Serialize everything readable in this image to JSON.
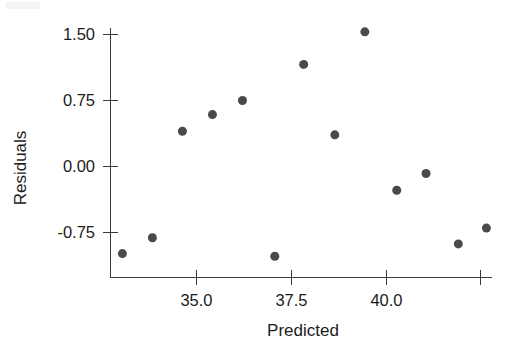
{
  "chart_data": {
    "type": "scatter",
    "title": "",
    "subtitle": "",
    "xlabel": "Predicted",
    "ylabel": "Residuals",
    "xlim": [
      32.6,
      43.1
    ],
    "ylim": [
      -1.15,
      1.7
    ],
    "x_ticks": [
      35.0,
      37.5,
      40.0,
      42.5
    ],
    "x_tick_labels": [
      "35.0",
      "37.5",
      "40.0",
      ""
    ],
    "y_ticks": [
      -0.75,
      0.0,
      0.75,
      1.5
    ],
    "y_tick_labels": [
      "-0.75",
      "0.00",
      "0.75",
      "1.50"
    ],
    "grid": false,
    "legend": null,
    "legend_position": "none",
    "marker": "filled-circle",
    "marker_color": "#4a4a4a",
    "marker_size": 9,
    "axis_color": "#3a3a3a",
    "background_color": "#ffffff",
    "n_points": 13,
    "x": [
      33.05,
      33.84,
      34.63,
      35.42,
      36.21,
      37.06,
      37.82,
      38.64,
      39.43,
      40.27,
      41.04,
      41.89,
      42.63
    ],
    "y": [
      -0.99,
      -0.81,
      0.4,
      0.59,
      0.75,
      -1.02,
      1.16,
      0.36,
      1.53,
      -0.27,
      -0.08,
      -0.88,
      -0.7
    ],
    "points": [
      {
        "x": 33.05,
        "y": -0.99
      },
      {
        "x": 33.84,
        "y": -0.81
      },
      {
        "x": 34.63,
        "y": 0.4
      },
      {
        "x": 35.42,
        "y": 0.59
      },
      {
        "x": 36.21,
        "y": 0.75
      },
      {
        "x": 37.06,
        "y": -1.02
      },
      {
        "x": 37.82,
        "y": 1.16
      },
      {
        "x": 38.64,
        "y": 0.36
      },
      {
        "x": 39.43,
        "y": 1.53
      },
      {
        "x": 40.27,
        "y": -0.27
      },
      {
        "x": 41.04,
        "y": -0.08
      },
      {
        "x": 41.89,
        "y": -0.88
      },
      {
        "x": 42.63,
        "y": -0.7
      }
    ]
  },
  "axes": {
    "x_title": "Predicted",
    "y_title": "Residuals"
  },
  "ticks": {
    "x": [
      {
        "value": 35.0,
        "label": "35.0"
      },
      {
        "value": 37.5,
        "label": "37.5"
      },
      {
        "value": 40.0,
        "label": "40.0"
      },
      {
        "value": 42.5,
        "label": ""
      }
    ],
    "y": [
      {
        "value": 1.5,
        "label": "1.50"
      },
      {
        "value": 0.75,
        "label": "0.75"
      },
      {
        "value": 0.0,
        "label": "0.00"
      },
      {
        "value": -0.75,
        "label": "-0.75"
      }
    ]
  }
}
